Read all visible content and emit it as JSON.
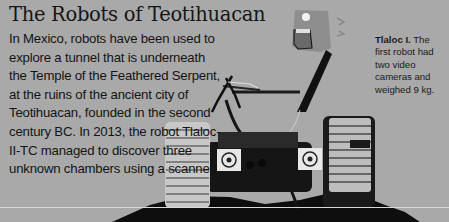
{
  "article": {
    "title": "The Robots of Teotihuacan",
    "body": "In Mexico, robots have been used to explore a tunnel that is underneath the Temple of the Feathered Serpent, at the ruins of the ancient city of Teotihuacan, founded in the second century BC. In 2013, the robot Tlaloc-II-TC managed to discover three unknown chambers using a scanner.",
    "body_lines": [
      "In Mexico, robots have been used to explore",
      "a tunnel that is underneath the Temple of",
      "the Feathered Serpent, at the ruins of the",
      "ancient city of Teotihuacan, founded in the",
      "second century BC. In 2013, the robot",
      "Tlaloc-II-TC managed to",
      "discover three unknown",
      "chambers using a scanner."
    ]
  },
  "caption": {
    "label": "Tlaloc I.",
    "text": " The first robot had two video cameras and weighed 9 kg."
  },
  "image": {
    "subject": "Tlaloc robot with tank treads, camera arm and emblem stickers",
    "background_color": "#a9a9a9"
  }
}
